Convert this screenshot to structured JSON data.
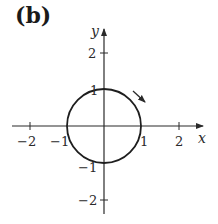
{
  "panel": {
    "label": "(b)"
  },
  "axes": {
    "x_label": "x",
    "y_label": "y",
    "x_ticks": [
      {
        "value": -2,
        "label": "−2"
      },
      {
        "value": -1,
        "label": "−1"
      },
      {
        "value": 1,
        "label": "1"
      },
      {
        "value": 2,
        "label": "2"
      }
    ],
    "y_ticks": [
      {
        "value": 2,
        "label": "2"
      },
      {
        "value": 1,
        "label": "1"
      },
      {
        "value": -1,
        "label": "−1"
      },
      {
        "value": -2,
        "label": "−2"
      }
    ],
    "range": {
      "x": [
        -2.5,
        2.7
      ],
      "y": [
        -2.4,
        2.6
      ]
    }
  },
  "curve": {
    "type": "unit-circle",
    "center": [
      0,
      0
    ],
    "radius": 1,
    "orientation": "clockwise",
    "orientation_arrow": "arrow near upper-right pointing down-right"
  },
  "colors": {
    "stroke": "#2a2a2a",
    "background": "#ffffff"
  }
}
